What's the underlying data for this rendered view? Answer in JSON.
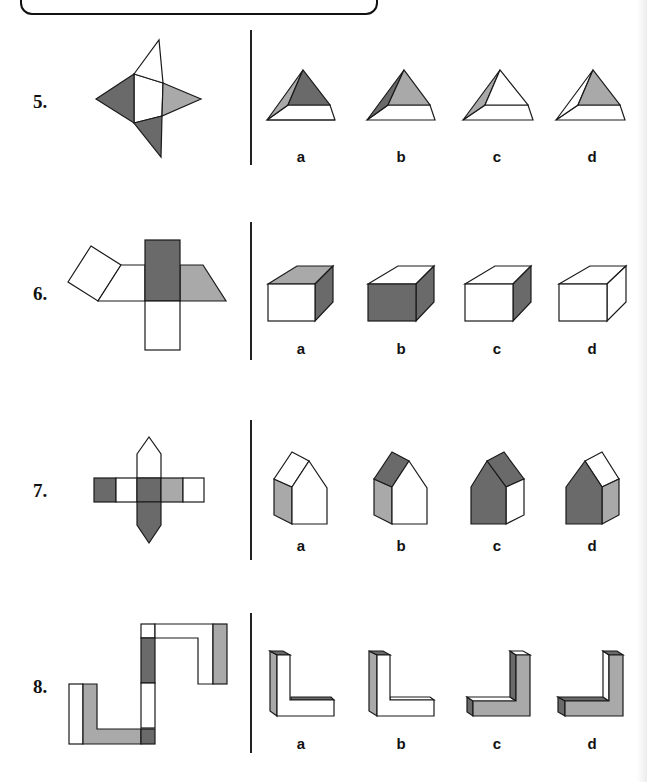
{
  "colors": {
    "dark": "#6a6a6a",
    "light": "#a9a9a9",
    "white": "#ffffff",
    "stroke": "#1a1a1a"
  },
  "questions": [
    {
      "number": "5.",
      "options": [
        {
          "label": "a"
        },
        {
          "label": "b"
        },
        {
          "label": "c"
        },
        {
          "label": "d"
        }
      ],
      "shape": "square pyramid"
    },
    {
      "number": "6.",
      "options": [
        {
          "label": "a"
        },
        {
          "label": "b"
        },
        {
          "label": "c"
        },
        {
          "label": "d"
        }
      ],
      "shape": "prism"
    },
    {
      "number": "7.",
      "options": [
        {
          "label": "a"
        },
        {
          "label": "b"
        },
        {
          "label": "c"
        },
        {
          "label": "d"
        }
      ],
      "shape": "house prism"
    },
    {
      "number": "8.",
      "options": [
        {
          "label": "a"
        },
        {
          "label": "b"
        },
        {
          "label": "c"
        },
        {
          "label": "d"
        }
      ],
      "shape": "L-shaped block"
    }
  ]
}
